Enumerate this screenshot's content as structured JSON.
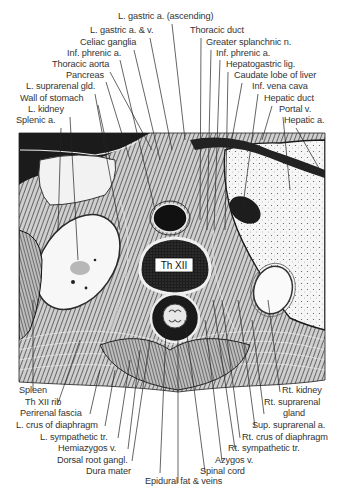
{
  "figure": {
    "vertebra_label": "Th XII",
    "top_labels": [
      {
        "text": "L. gastric a. (ascending)",
        "x": 118,
        "y": 19
      },
      {
        "text": "L. gastric a. & v.",
        "x": 90,
        "y": 33
      },
      {
        "text": "Thoracic duct",
        "x": 190,
        "y": 33
      },
      {
        "text": "Celiac ganglia",
        "x": 80,
        "y": 45
      },
      {
        "text": "Greater splanchnic n.",
        "x": 206,
        "y": 45
      },
      {
        "text": "Inf. phrenic a.",
        "x": 67,
        "y": 56
      },
      {
        "text": "Inf. phrenic a.",
        "x": 216,
        "y": 56
      },
      {
        "text": "Thoracic aorta",
        "x": 52,
        "y": 67
      },
      {
        "text": "Hepatogastric lig.",
        "x": 226,
        "y": 67
      },
      {
        "text": "Pancreas",
        "x": 66,
        "y": 78
      },
      {
        "text": "Caudate lobe of liver",
        "x": 234,
        "y": 78
      },
      {
        "text": "L. suprarenal gld.",
        "x": 26,
        "y": 89
      },
      {
        "text": "Inf. vena cava",
        "x": 252,
        "y": 89
      },
      {
        "text": "Wall of stomach",
        "x": 20,
        "y": 101
      },
      {
        "text": "Hepatic duct",
        "x": 264,
        "y": 101
      },
      {
        "text": "L. kidney",
        "x": 28,
        "y": 112
      },
      {
        "text": "Portal v.",
        "x": 279,
        "y": 112
      },
      {
        "text": "Splenic a.",
        "x": 16,
        "y": 123
      },
      {
        "text": "Hepatic a.",
        "x": 284,
        "y": 123
      }
    ],
    "bottom_left_labels": [
      {
        "text": "Spleen",
        "x": 19,
        "y": 393
      },
      {
        "text": "Th XII rib",
        "x": 25,
        "y": 405
      },
      {
        "text": "Perirenal fascia",
        "x": 20,
        "y": 416
      },
      {
        "text": "L. crus of diaphragm",
        "x": 16,
        "y": 428
      },
      {
        "text": "L. sympathetic tr.",
        "x": 40,
        "y": 440
      },
      {
        "text": "Hemiazygos v.",
        "x": 58,
        "y": 451
      },
      {
        "text": "Dorsal root gangl.",
        "x": 57,
        "y": 463
      },
      {
        "text": "Dura mater",
        "x": 86,
        "y": 474
      },
      {
        "text": "Epidural fat & veins",
        "x": 145,
        "y": 484
      }
    ],
    "bottom_right_labels": [
      {
        "text": "Rt. kidney",
        "x": 282,
        "y": 393
      },
      {
        "text": "Rt. suprarenal",
        "x": 264,
        "y": 405
      },
      {
        "text": "gland",
        "x": 283,
        "y": 416
      },
      {
        "text": "Sup. suprarenal a.",
        "x": 252,
        "y": 428
      },
      {
        "text": "Rt. crus of diaphragm",
        "x": 242,
        "y": 440
      },
      {
        "text": "Rt. sympathetic tr.",
        "x": 228,
        "y": 451
      },
      {
        "text": "Azygos v.",
        "x": 215,
        "y": 463
      },
      {
        "text": "Spinal cord",
        "x": 200,
        "y": 474
      }
    ],
    "colors": {
      "ink": "#1a1a1a",
      "tissue_dark": "#2b2b2b",
      "tissue_mid": "#6e6e6e",
      "organ_light": "#f4f4f4",
      "background": "#ffffff"
    }
  }
}
